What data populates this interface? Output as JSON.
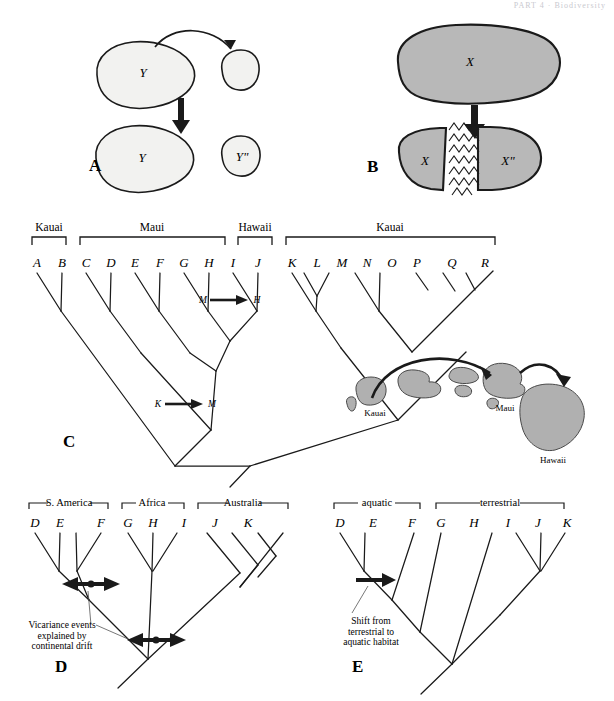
{
  "running_head": "PART 4 · Biodiversity",
  "panels": {
    "A": {
      "letter": "A",
      "caption_type": "dispersal",
      "source_label": "Y",
      "result_labels": [
        "Y",
        "Y\""
      ],
      "fill_color": "#f2f2f0",
      "stroke_color": "#1a1a1a"
    },
    "B": {
      "letter": "B",
      "caption_type": "vicariance",
      "source_label": "X",
      "result_labels": [
        "X",
        "X\""
      ],
      "fill_color": "#b8b8b8",
      "stroke_color": "#1a1a1a"
    },
    "C": {
      "letter": "C",
      "taxa": [
        "A",
        "B",
        "C",
        "D",
        "E",
        "F",
        "G",
        "H",
        "I",
        "J",
        "K",
        "L",
        "M",
        "N",
        "O",
        "P",
        "Q",
        "R"
      ],
      "groups": [
        {
          "label": "Kauai",
          "taxa": [
            "A",
            "B"
          ]
        },
        {
          "label": "Maui",
          "taxa": [
            "C",
            "D",
            "E",
            "F",
            "G",
            "H"
          ]
        },
        {
          "label": "Hawaii",
          "taxa": [
            "I",
            "J"
          ]
        },
        {
          "label": "Kauai",
          "taxa": [
            "K",
            "L",
            "M",
            "N",
            "O",
            "P",
            "Q",
            "R"
          ]
        }
      ],
      "dispersal_events": [
        {
          "from": "M",
          "to": "H"
        },
        {
          "from": "K",
          "to": "M"
        }
      ],
      "map": {
        "island_labels": [
          "Kauai",
          "Maui",
          "Hawaii"
        ],
        "arrow_count": 2,
        "island_fill": "#b0b0b0"
      }
    },
    "D": {
      "letter": "D",
      "taxa": [
        "D",
        "E",
        "F",
        "G",
        "H",
        "I",
        "J",
        "K"
      ],
      "groups": [
        {
          "label": "S. America",
          "taxa": [
            "D",
            "E"
          ]
        },
        {
          "label": "Africa",
          "taxa": [
            "F",
            "G"
          ]
        },
        {
          "label": "Australia",
          "taxa": [
            "H",
            "I",
            "J",
            "K"
          ]
        }
      ],
      "annotation": "Vicariance events\nexplained by\ncontinental drift",
      "event_marker_count": 2,
      "marker_type": "double-headed-arrow"
    },
    "E": {
      "letter": "E",
      "taxa": [
        "D",
        "E",
        "F",
        "G",
        "H",
        "I",
        "J",
        "K"
      ],
      "groups": [
        {
          "label": "aquatic",
          "taxa": [
            "D",
            "E",
            "F"
          ]
        },
        {
          "label": "terrestrial",
          "taxa": [
            "G",
            "H",
            "I",
            "J",
            "K"
          ]
        }
      ],
      "annotation": "Shift from\nterrestrial to\naquatic habitat",
      "event_marker_count": 1,
      "marker_type": "single-arrow"
    }
  }
}
